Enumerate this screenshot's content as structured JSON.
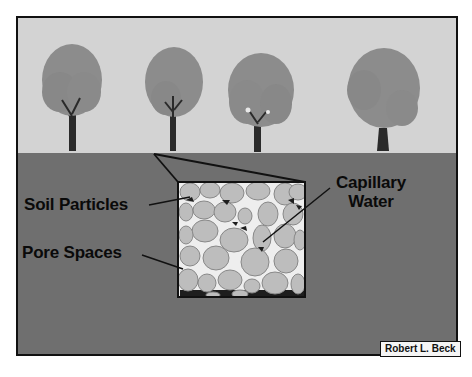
{
  "diagram": {
    "type": "soil cross-section illustration",
    "labels": {
      "soil_particles": "Soil Particles",
      "pore_spaces": "Pore Spaces",
      "capillary_water_line1": "Capillary",
      "capillary_water_line2": "Water"
    },
    "credit": "Robert L. Beck",
    "tree_count": 4,
    "colors": {
      "sky": "#d3d3d3",
      "ground": "#6f6f6f",
      "foliage": "#8c8c8c",
      "trunk": "#2a2a2a",
      "particle": "#bdbdbd",
      "pore": "#eeeeee",
      "water": "#1e1e1e"
    }
  }
}
